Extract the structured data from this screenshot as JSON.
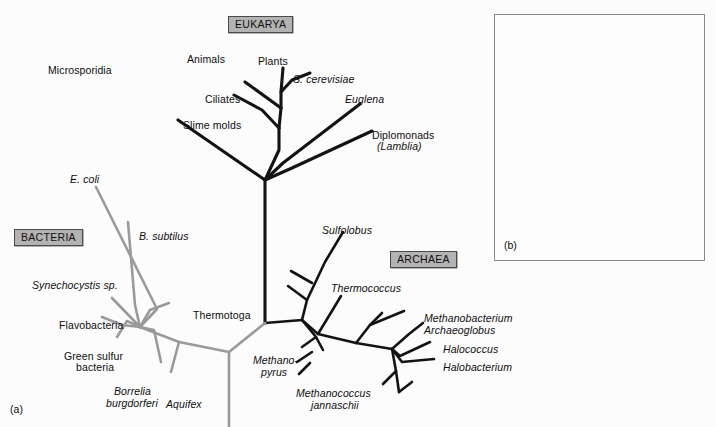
{
  "figure": {
    "panel_a_label": "(a)",
    "panel_b_label": "(b)"
  },
  "domains": [
    {
      "id": "eukarya",
      "label": "EUKARYA",
      "x": 228,
      "y": 16,
      "color": "#b3b3b3"
    },
    {
      "id": "bacteria",
      "label": "BACTERIA",
      "x": 14,
      "y": 229,
      "color": "#b3b3b3"
    },
    {
      "id": "archaea",
      "label": "ARCHAEA",
      "x": 390,
      "y": 251,
      "color": "#b3b3b3"
    }
  ],
  "colors": {
    "eukarya_branch": "#131313",
    "archaea_branch": "#131313",
    "bacteria_branch": "#9a9a9a",
    "background": "#fcfcfc",
    "box_fill": "#b3b3b3",
    "box_border": "#4a4a4a",
    "panel_border": "#8a8a8a"
  },
  "taxa": {
    "eukarya": [
      {
        "name": "Microsporidia",
        "italic": false,
        "x": 48,
        "y": 65,
        "align": "left"
      },
      {
        "name": "Animals",
        "italic": false,
        "x": 187,
        "y": 54,
        "align": "left"
      },
      {
        "name": "Plants",
        "italic": false,
        "x": 258,
        "y": 56,
        "align": "left"
      },
      {
        "name": "S. cerevisiae",
        "italic": true,
        "x": 293,
        "y": 74,
        "align": "left"
      },
      {
        "name": "Ciliates",
        "italic": false,
        "x": 205,
        "y": 94,
        "align": "left"
      },
      {
        "name": "Euglena",
        "italic": true,
        "x": 345,
        "y": 94,
        "align": "left"
      },
      {
        "name": "Slime molds",
        "italic": false,
        "x": 183,
        "y": 120,
        "align": "left"
      },
      {
        "name": "Diplomonads",
        "italic": false,
        "x": 372,
        "y": 130,
        "align": "left"
      },
      {
        "name": "(Lamblia)",
        "italic": true,
        "x": 377,
        "y": 141,
        "align": "left"
      }
    ],
    "bacteria": [
      {
        "name": "E. coli",
        "italic": true,
        "x": 70,
        "y": 174,
        "align": "left"
      },
      {
        "name": "B. subtilus",
        "italic": true,
        "x": 139,
        "y": 231,
        "align": "left"
      },
      {
        "name": "Synechocystis sp.",
        "italic": true,
        "x": 32,
        "y": 280,
        "align": "left"
      },
      {
        "name": "Thermotoga",
        "italic": false,
        "x": 193,
        "y": 310,
        "align": "left"
      },
      {
        "name": "Flavobacteria",
        "italic": false,
        "x": 59,
        "y": 320,
        "align": "left"
      },
      {
        "name": "Green sulfur",
        "italic": false,
        "x": 64,
        "y": 351,
        "align": "left"
      },
      {
        "name": "bacteria",
        "italic": false,
        "x": 76,
        "y": 362,
        "align": "left"
      },
      {
        "name": "Borrelia",
        "italic": true,
        "x": 114,
        "y": 386,
        "align": "left"
      },
      {
        "name": "burgdorferi",
        "italic": true,
        "x": 106,
        "y": 398,
        "align": "left"
      },
      {
        "name": "Aquifex",
        "italic": true,
        "x": 166,
        "y": 399,
        "align": "left"
      }
    ],
    "archaea": [
      {
        "name": "Sulfolobus",
        "italic": true,
        "x": 322,
        "y": 225,
        "align": "left"
      },
      {
        "name": "Thermococcus",
        "italic": true,
        "x": 331,
        "y": 283,
        "align": "left"
      },
      {
        "name": "Methanobacterium",
        "italic": true,
        "x": 424,
        "y": 313,
        "align": "left"
      },
      {
        "name": "Archaeoglobus",
        "italic": true,
        "x": 424,
        "y": 325,
        "align": "left"
      },
      {
        "name": "Halococcus",
        "italic": true,
        "x": 443,
        "y": 344,
        "align": "left"
      },
      {
        "name": "Halobacterium",
        "italic": true,
        "x": 443,
        "y": 362,
        "align": "left"
      },
      {
        "name": "Methano-",
        "italic": true,
        "x": 253,
        "y": 355,
        "align": "left"
      },
      {
        "name": "pyrus",
        "italic": true,
        "x": 261,
        "y": 367,
        "align": "left"
      },
      {
        "name": "Methanococcus",
        "italic": true,
        "x": 296,
        "y": 388,
        "align": "left"
      },
      {
        "name": "jannaschii",
        "italic": true,
        "x": 311,
        "y": 400,
        "align": "left"
      }
    ]
  },
  "tree_a": {
    "description": "Unrooted universal phylogenetic tree, panel (a)",
    "root": {
      "x": 265,
      "y": 323
    },
    "eukarya_paths": [
      "M265,323 L265,180",
      "M265,180 L178,120",
      "M265,180 L279,150 L279,128",
      "M279,128 L262,110 L234,95",
      "M279,128 L281,108",
      "M281,108 L245,82",
      "M281,108 L281,92 L283,68",
      "M281,92 L292,80 L310,73",
      "M265,180 L283,163 L360,104",
      "M265,180 L292,168 L372,131"
    ],
    "bacteria_paths": [
      "M265,323 L229,352",
      "M229,352 L229,427",
      "M229,352 L179,342 L140,327",
      "M179,342 L171,372",
      "M140,327 L112,298",
      "M140,327 L154,330 L161,362",
      "M140,327 L127,321 L117,337",
      "M140,327 L122,325 L102,317",
      "M140,327 L135,305 L128,222",
      "M140,327 L150,310 L169,303",
      "M140,327 L157,309 L96,187"
    ],
    "archaea_paths": [
      "M265,323 L302,320",
      "M302,320 L307,300 L325,262 L343,232",
      "M307,300 L288,286",
      "M312,283 L291,271",
      "M302,320 L318,334 L341,296",
      "M302,320 L316,337 L323,350",
      "M316,337 L302,347",
      "M312,352 L297,362",
      "M310,363 L299,374",
      "M318,334 L356,343 L392,349",
      "M356,343 L370,325 L382,313",
      "M370,325 L404,311",
      "M392,349 L409,334 L423,323",
      "M392,349 L400,356 L430,342",
      "M392,349 L402,362 L434,359",
      "M392,349 L396,371 L399,392",
      "M396,371 L383,384",
      "M399,392 L412,382"
    ]
  },
  "tree_b": {
    "description": "Inset unrooted tree, panel (b)",
    "frame": {
      "x": 494,
      "y": 14,
      "w": 211,
      "h": 247
    },
    "center": {
      "x": 601,
      "y": 133
    },
    "dark_paths": [
      "M601,133 L601,82 L598,36",
      "M601,82 L567,47",
      "M601,82 L630,53 L646,31",
      "M601,133 L640,100 L667,79",
      "M601,133 L563,117 L527,107",
      "M601,133 L589,160 L578,182"
    ],
    "light_paths": [
      "M601,133 L565,110 L525,78",
      "M601,133 L550,136 L512,138",
      "M601,133 L652,132 L698,130",
      "M601,133 L655,116 L692,109",
      "M601,133 L651,146 L681,156",
      "M601,133 L570,155 L545,166",
      "M601,133 L579,164 L541,200",
      "M601,133 L596,170 L587,235",
      "M601,133 L630,160 L635,194"
    ]
  }
}
